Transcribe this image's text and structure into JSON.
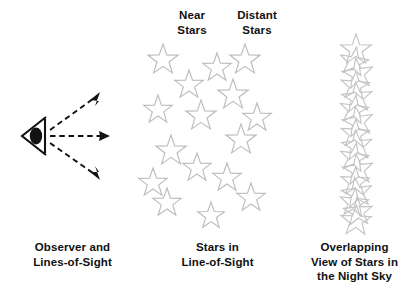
{
  "figure": {
    "background_color": "#ffffff",
    "star_outline_color": "#bcbcbc",
    "star_fill_color": "#ffffff",
    "line_color": "#121212",
    "text_color": "#111111"
  },
  "labels": {
    "near_stars": "Near\nStars",
    "distant_stars": "Distant\nStars"
  },
  "captions": {
    "observer": "Observer and\nLines-of-Sight",
    "starfield": "Stars in\nLine-of-Sight",
    "overlap": "Overlapping\nView of Stars in\nthe Night Sky"
  },
  "panels": {
    "observer": {
      "eye": {
        "cx": 33,
        "cy": 136,
        "label": "observer-eye"
      },
      "lines_of_sight": [
        {
          "name": "upper-line-of-sight",
          "x1": 48,
          "y1": 133,
          "x2": 96,
          "y2": 98,
          "angle_deg": -36
        },
        {
          "name": "middle-line-of-sight",
          "x1": 48,
          "y1": 136,
          "x2": 104,
          "y2": 136,
          "angle_deg": 0
        },
        {
          "name": "lower-line-of-sight",
          "x1": 48,
          "y1": 140,
          "x2": 96,
          "y2": 176,
          "angle_deg": 36
        }
      ]
    },
    "starfield": {
      "star_count": 16,
      "star_outline_size": 30,
      "stars": [
        {
          "cx": 18,
          "cy": 22,
          "r": 16,
          "rot": 0,
          "group": "near"
        },
        {
          "cx": 44,
          "cy": 47,
          "r": 15,
          "rot": 0,
          "group": "near"
        },
        {
          "cx": 13,
          "cy": 72,
          "r": 15,
          "rot": 0,
          "group": "near"
        },
        {
          "cx": 56,
          "cy": 78,
          "r": 16,
          "rot": 0,
          "group": "near"
        },
        {
          "cx": 26,
          "cy": 113,
          "r": 16,
          "rot": 0,
          "group": "near"
        },
        {
          "cx": 8,
          "cy": 145,
          "r": 15,
          "rot": 0,
          "group": "near"
        },
        {
          "cx": 52,
          "cy": 130,
          "r": 15,
          "rot": 0,
          "group": "near"
        },
        {
          "cx": 22,
          "cy": 165,
          "r": 15,
          "rot": 0,
          "group": "near"
        },
        {
          "cx": 72,
          "cy": 30,
          "r": 15,
          "rot": 0,
          "group": "distant"
        },
        {
          "cx": 100,
          "cy": 22,
          "r": 16,
          "rot": 0,
          "group": "distant"
        },
        {
          "cx": 88,
          "cy": 57,
          "r": 16,
          "rot": 0,
          "group": "distant"
        },
        {
          "cx": 112,
          "cy": 80,
          "r": 15,
          "rot": 0,
          "group": "distant"
        },
        {
          "cx": 96,
          "cy": 102,
          "r": 16,
          "rot": 0,
          "group": "distant"
        },
        {
          "cx": 82,
          "cy": 140,
          "r": 15,
          "rot": 0,
          "group": "distant"
        },
        {
          "cx": 106,
          "cy": 160,
          "r": 15,
          "rot": 0,
          "group": "distant"
        },
        {
          "cx": 66,
          "cy": 178,
          "r": 14,
          "rot": 0,
          "group": "distant"
        }
      ]
    },
    "overlap": {
      "column_center_x": 66,
      "column_top": 40,
      "column_bottom": 228,
      "star_count": 16,
      "stars": [
        {
          "cx": 66,
          "cy": 50,
          "r": 16,
          "rot": 0
        },
        {
          "cx": 64,
          "cy": 62,
          "r": 15,
          "rot": 10
        },
        {
          "cx": 68,
          "cy": 74,
          "r": 16,
          "rot": -8
        },
        {
          "cx": 65,
          "cy": 86,
          "r": 15,
          "rot": 5
        },
        {
          "cx": 67,
          "cy": 98,
          "r": 16,
          "rot": -5
        },
        {
          "cx": 64,
          "cy": 110,
          "r": 15,
          "rot": 8
        },
        {
          "cx": 68,
          "cy": 122,
          "r": 16,
          "rot": -10
        },
        {
          "cx": 65,
          "cy": 134,
          "r": 15,
          "rot": 4
        },
        {
          "cx": 67,
          "cy": 146,
          "r": 16,
          "rot": -6
        },
        {
          "cx": 64,
          "cy": 158,
          "r": 15,
          "rot": 9
        },
        {
          "cx": 68,
          "cy": 170,
          "r": 16,
          "rot": -7
        },
        {
          "cx": 65,
          "cy": 182,
          "r": 15,
          "rot": 3
        },
        {
          "cx": 67,
          "cy": 193,
          "r": 16,
          "rot": -9
        },
        {
          "cx": 64,
          "cy": 203,
          "r": 15,
          "rot": 6
        },
        {
          "cx": 68,
          "cy": 212,
          "r": 15,
          "rot": -4
        },
        {
          "cx": 66,
          "cy": 221,
          "r": 16,
          "rot": 2
        }
      ]
    }
  }
}
